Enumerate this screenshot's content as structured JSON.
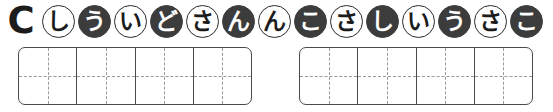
{
  "worksheet": {
    "section_letter": "C",
    "kana_row": {
      "name": "circled-kana-sequence",
      "chips": [
        {
          "char": "し",
          "fill": "light"
        },
        {
          "char": "う",
          "fill": "dark"
        },
        {
          "char": "い",
          "fill": "light"
        },
        {
          "char": "ど",
          "fill": "dark"
        },
        {
          "char": "さ",
          "fill": "light"
        },
        {
          "char": "ん",
          "fill": "dark"
        },
        {
          "char": "ん",
          "fill": "light"
        },
        {
          "char": "こ",
          "fill": "dark"
        },
        {
          "char": "さ",
          "fill": "light"
        },
        {
          "char": "し",
          "fill": "dark"
        },
        {
          "char": "い",
          "fill": "light"
        },
        {
          "char": "う",
          "fill": "dark"
        },
        {
          "char": "さ",
          "fill": "light"
        },
        {
          "char": "こ",
          "fill": "dark"
        }
      ]
    },
    "grids": [
      {
        "name": "answer-grid-left",
        "cells": 4,
        "values": [
          "",
          "",
          "",
          ""
        ]
      },
      {
        "name": "answer-grid-right",
        "cells": 4,
        "values": [
          "",
          "",
          "",
          ""
        ]
      }
    ],
    "colors": {
      "ink": "#1c1c1c",
      "chip_dark": "#3c3c3c",
      "chip_light": "#ffffff",
      "grid_line": "#4a4a4a",
      "guide_line": "#9a9a9a",
      "page": "#ffffff"
    },
    "layout": {
      "chip_diameter": 33,
      "chip_pitch": 36,
      "chip_start_x": 42,
      "chip_top": 5,
      "grid_top": 47,
      "grid_height": 58,
      "grid_left_x": 18,
      "grid_left_width": 234,
      "grid_right_x": 299,
      "grid_right_width": 234
    }
  }
}
